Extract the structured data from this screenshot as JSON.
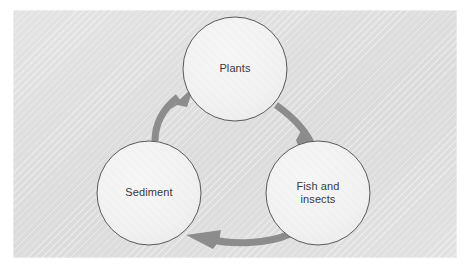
{
  "panel": {
    "background_color": "#e2e2e2",
    "border_color": "#d2d2d2"
  },
  "diagram": {
    "type": "cycle",
    "direction": "clockwise",
    "node_fill": "#f2f2f2",
    "node_stroke": "#595959",
    "arrow_color": "#8c8c8c",
    "label_color": "#3a3a3a",
    "nodes": [
      {
        "id": "plants",
        "label": "Plants",
        "lines": [
          "Plants"
        ],
        "cx": 235,
        "cy": 69,
        "r": 52
      },
      {
        "id": "fish-and-insects",
        "label": "Fish and insects",
        "lines": [
          "Fish and",
          "insects"
        ],
        "cx": 318,
        "cy": 193,
        "r": 52
      },
      {
        "id": "sediment",
        "label": "Sediment",
        "lines": [
          "Sediment"
        ],
        "cx": 149,
        "cy": 193,
        "r": 52
      }
    ],
    "arrows": [
      {
        "id": "plants-to-fish",
        "from": "plants",
        "to": "fish-and-insects"
      },
      {
        "id": "fish-to-sediment",
        "from": "fish-and-insects",
        "to": "sediment"
      },
      {
        "id": "sediment-to-plants",
        "from": "sediment",
        "to": "plants"
      }
    ]
  }
}
